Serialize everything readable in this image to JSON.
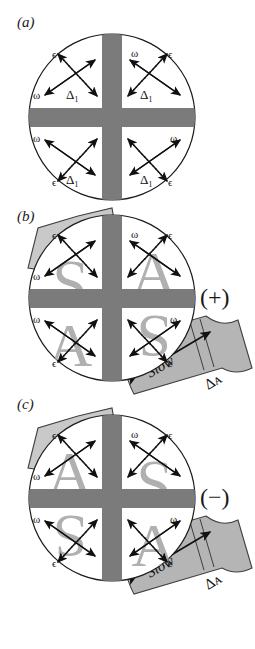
{
  "figure": {
    "caption_labels": {
      "a": "(a)",
      "b": "(b)",
      "c": "(c)"
    },
    "colors": {
      "cross_gray": "#7b7b7b",
      "letter_gray": "#b0b0b0",
      "ribbon_gray": "#b5b5b5",
      "ribbon_edge": "#5a5a5a",
      "tab_gray": "#c9c9c9",
      "outline": "#1a1a1a",
      "background": "#ffffff"
    },
    "symbols": {
      "epsilon": "ϵ",
      "omega": "ω",
      "delta_one": "Δ₁",
      "delta_a": "Δᴀ",
      "plus_sign": "(+)",
      "minus_sign": "(−)",
      "slow": "Slow"
    }
  },
  "panels": [
    {
      "id": "a",
      "label": "(a)",
      "sign": "",
      "has_tab": false,
      "has_ribbon": false,
      "quadrants": [
        {
          "position": "top-left",
          "letter": "",
          "epsilon": "ϵ",
          "omega": "ω",
          "delta": "Δ₁"
        },
        {
          "position": "top-right",
          "letter": "",
          "epsilon": "ϵ",
          "omega": "ω",
          "delta": "Δ₁"
        },
        {
          "position": "bottom-left",
          "letter": "",
          "epsilon": "ϵ",
          "omega": "ω",
          "delta": "Δ₁"
        },
        {
          "position": "bottom-right",
          "letter": "",
          "epsilon": "ϵ",
          "omega": "ω",
          "delta": "Δ₁"
        }
      ]
    },
    {
      "id": "b",
      "label": "(b)",
      "sign": "(+)",
      "has_tab": true,
      "has_ribbon": true,
      "ribbon_text": "Slow",
      "ribbon_delta": "Δᴀ",
      "quadrants": [
        {
          "position": "top-left",
          "letter": "S",
          "epsilon": "ϵ",
          "omega": "ω",
          "delta": ""
        },
        {
          "position": "top-right",
          "letter": "A",
          "epsilon": "ϵ",
          "omega": "ω",
          "delta": ""
        },
        {
          "position": "bottom-left",
          "letter": "A",
          "epsilon": "ϵ",
          "omega": "ω",
          "delta": ""
        },
        {
          "position": "bottom-right",
          "letter": "S",
          "epsilon": "ϵ",
          "omega": "ω",
          "delta": ""
        }
      ]
    },
    {
      "id": "c",
      "label": "(c)",
      "sign": "(−)",
      "has_tab": true,
      "has_ribbon": true,
      "ribbon_text": "Slow",
      "ribbon_delta": "Δᴀ",
      "quadrants": [
        {
          "position": "top-left",
          "letter": "A",
          "epsilon": "ϵ",
          "omega": "ω",
          "delta": ""
        },
        {
          "position": "top-right",
          "letter": "S",
          "epsilon": "ϵ",
          "omega": "ω",
          "delta": ""
        },
        {
          "position": "bottom-left",
          "letter": "S",
          "epsilon": "ϵ",
          "omega": "ω",
          "delta": ""
        },
        {
          "position": "bottom-right",
          "letter": "A",
          "epsilon": "ϵ",
          "omega": "ω",
          "delta": ""
        }
      ]
    }
  ]
}
